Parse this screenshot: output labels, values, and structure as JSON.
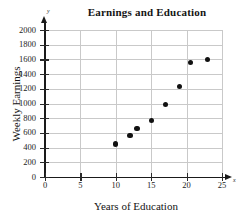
{
  "chart_data": {
    "type": "scatter",
    "title": "Earnings and Education",
    "xlabel": "Years of Education",
    "ylabel": "Weekly Earnings",
    "xlim": [
      0,
      25
    ],
    "ylim": [
      0,
      2000
    ],
    "grid": true,
    "legend": null,
    "x_axis_letter": "x",
    "y_axis_letter": "y",
    "xticks": [
      0,
      5,
      10,
      15,
      20,
      25
    ],
    "yticks": [
      0,
      200,
      400,
      600,
      800,
      1000,
      1200,
      1400,
      1600,
      1800,
      2000
    ],
    "xtick_labels": [
      "0",
      "5",
      "10",
      "15",
      "20",
      "25"
    ],
    "ytick_labels": [
      "0",
      "200",
      "400",
      "600",
      "800",
      "1000",
      "1200",
      "1400",
      "1600",
      "1800",
      "2000"
    ],
    "point_color": "#111111",
    "grid_color": "#c9c9c9",
    "axis_color": "#1a1a1a",
    "x": [
      10,
      12,
      13,
      15,
      17,
      19,
      20.5,
      23
    ],
    "y": [
      450,
      570,
      665,
      770,
      990,
      1230,
      1555,
      1600
    ],
    "points": [
      {
        "x": 10,
        "y": 450
      },
      {
        "x": 12,
        "y": 570
      },
      {
        "x": 13,
        "y": 665
      },
      {
        "x": 15,
        "y": 770
      },
      {
        "x": 17,
        "y": 990
      },
      {
        "x": 19,
        "y": 1230
      },
      {
        "x": 20.5,
        "y": 1555
      },
      {
        "x": 23,
        "y": 1600
      }
    ]
  }
}
